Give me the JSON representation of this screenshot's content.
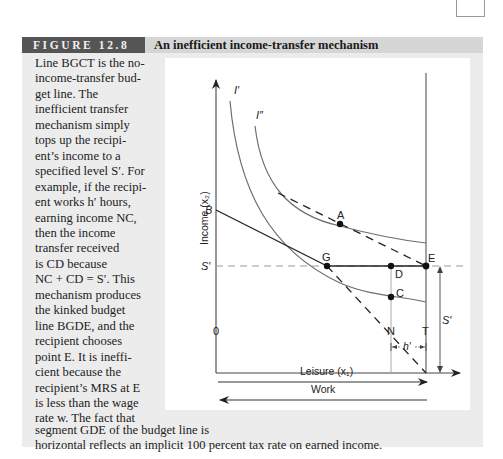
{
  "figure": {
    "label": "FIGURE 12.8",
    "title": "An inefficient income-transfer mechanism"
  },
  "caption": {
    "lines": [
      "Line BGCT is the no-",
      "income-transfer bud-",
      "get line. The",
      "inefficient transfer",
      "mechanism simply",
      "tops up the recipi-",
      "ent’s income to a",
      "specified level S′. For",
      "example, if the recipi-",
      "ent works h′ hours,",
      "earning income NC,",
      "then the income",
      "transfer received",
      "is CD because",
      "NC + CD = S′. This",
      "mechanism produces",
      "the kinked budget",
      "line BGDE, and the",
      "recipient chooses",
      "point E. It is ineffi-",
      "cient because the",
      "recipient’s MRS at E",
      "is less than the wage",
      "rate w. The fact that"
    ],
    "tail_lines": [
      "segment GDE of the budget line is",
      "horizontal reflects an implicit 100 percent tax rate on earned income."
    ]
  },
  "diagram": {
    "y_axis_label": "Income (x₂)",
    "x_axis_label": "Leisure (x₁)",
    "work_label": "Work",
    "origin_label": "0",
    "curves": {
      "indifference_1": "I′",
      "indifference_2": "I″"
    },
    "points": {
      "B": "B",
      "S_prime": "S′",
      "G": "G",
      "D": "D",
      "E": "E",
      "C": "C",
      "A": "A",
      "N": "N",
      "T": "T"
    },
    "brackets": {
      "h_prime": "h′",
      "s_prime_right": "S′"
    },
    "colors": {
      "axis": "#333333",
      "curve": "#6e6e6e",
      "budget": "#222222",
      "dashed_guide": "#9a9a9a"
    }
  }
}
